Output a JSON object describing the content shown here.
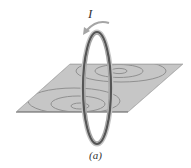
{
  "figure": {
    "current_label": "I",
    "caption": "(a)",
    "colors": {
      "plane_fill": "#c4c4c4",
      "plane_edge": "#9a9a9a",
      "field_lines": "#8f8f8f",
      "loop_dark": "#4a4a4a",
      "loop_light": "#b5b5b5",
      "arrow": "#a8a8a8",
      "text": "#333333"
    }
  }
}
